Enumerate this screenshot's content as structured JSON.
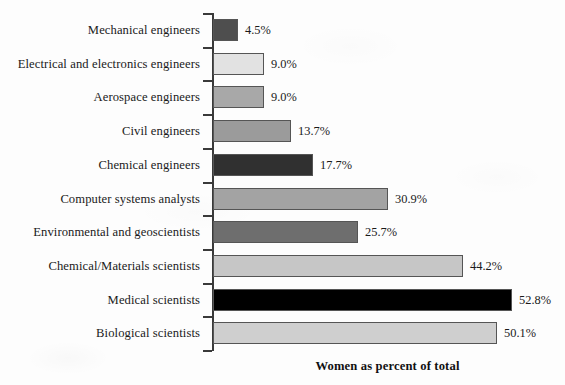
{
  "chart_data": {
    "type": "bar",
    "orientation": "horizontal",
    "title": "",
    "xlabel": "Women as percent of total",
    "ylabel": "",
    "xlim": [
      0,
      55
    ],
    "grid": false,
    "legend": null,
    "value_suffix": "%",
    "categories": [
      "Mechanical engineers",
      "Electrical and electronics engineers",
      "Aerospace engineers",
      "Civil engineers",
      "Chemical engineers",
      "Computer systems analysts",
      "Environmental and geoscientists",
      "Chemical/Materials scientists",
      "Medical scientists",
      "Biological scientists"
    ],
    "values": [
      4.5,
      9.0,
      9.0,
      13.7,
      17.7,
      30.9,
      25.7,
      44.2,
      52.8,
      50.1
    ],
    "value_labels": [
      "4.5%",
      "9.0%",
      "9.0%",
      "13.7%",
      "17.7%",
      "30.9%",
      "25.7%",
      "44.2%",
      "52.8%",
      "50.1%"
    ],
    "bar_colors": [
      "#4e4e4e",
      "#e2e2e2",
      "#a8a8a8",
      "#9b9b9b",
      "#303030",
      "#a3a3a3",
      "#6e6e6e",
      "#c6c6c6",
      "#000000",
      "#cfcfcf"
    ]
  },
  "axis": {
    "title": "Women as percent of total"
  }
}
